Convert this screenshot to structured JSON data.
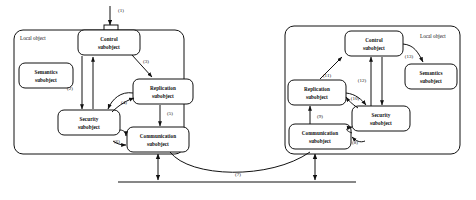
{
  "figure": {
    "stroke_color": "#111111",
    "background_color": "#ffffff"
  },
  "panels": [
    {
      "id": "left",
      "label": "Local object"
    },
    {
      "id": "right",
      "label": "Local object"
    }
  ],
  "left_panel": {
    "label": "Local object",
    "nodes": [
      {
        "id": "control",
        "line1": "Control",
        "line2": "subobject"
      },
      {
        "id": "semantics",
        "line1": "Semantics",
        "line2": "subobject"
      },
      {
        "id": "replication",
        "line1": "Replication",
        "line2": "subobject"
      },
      {
        "id": "security",
        "line1": "Security",
        "line2": "subobject"
      },
      {
        "id": "communication",
        "line1": "Communication",
        "line2": "subobject"
      }
    ],
    "edges": [
      {
        "id": "e1",
        "label": "(1)",
        "from": "external",
        "to": "control"
      },
      {
        "id": "e2",
        "label": "(2)",
        "from": "control",
        "to": "security"
      },
      {
        "id": "e3",
        "label": "(3)",
        "from": "control",
        "to": "replication"
      },
      {
        "id": "e4",
        "label": "(4)",
        "from": "replication",
        "to": "security"
      },
      {
        "id": "e5",
        "label": "(5)",
        "from": "replication",
        "to": "communication"
      },
      {
        "id": "e6",
        "label": "(6)",
        "from": "security",
        "to": "communication"
      }
    ]
  },
  "right_panel": {
    "label": "Local object",
    "nodes": [
      {
        "id": "control",
        "line1": "Control",
        "line2": "subobject"
      },
      {
        "id": "semantics",
        "line1": "Semantics",
        "line2": "subobject"
      },
      {
        "id": "replication",
        "line1": "Replication",
        "line2": "subobject"
      },
      {
        "id": "security",
        "line1": "Security",
        "line2": "subobject"
      },
      {
        "id": "communication",
        "line1": "Communication",
        "line2": "subobject"
      }
    ],
    "edges": [
      {
        "id": "e8",
        "label": "(8)",
        "from": "security",
        "to": "communication"
      },
      {
        "id": "e9",
        "label": "(9)",
        "from": "communication",
        "to": "replication"
      },
      {
        "id": "e10",
        "label": "(10)",
        "from": "replication",
        "to": "security"
      },
      {
        "id": "e11",
        "label": "(11)",
        "from": "replication",
        "to": "control"
      },
      {
        "id": "e12",
        "label": "(12)",
        "from": "security",
        "to": "control"
      },
      {
        "id": "e13",
        "label": "(13)",
        "from": "control",
        "to": "semantics"
      }
    ]
  },
  "network": {
    "label": "(7)",
    "description": "network link between communication subobjects"
  }
}
